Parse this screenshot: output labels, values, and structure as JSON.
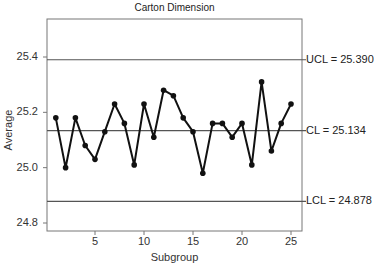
{
  "chart_data": {
    "type": "line",
    "title": "Carton Dimension",
    "xlabel": "Subgroup",
    "ylabel": "Average",
    "x": [
      1,
      2,
      3,
      4,
      5,
      6,
      7,
      8,
      9,
      10,
      11,
      12,
      13,
      14,
      15,
      16,
      17,
      18,
      19,
      20,
      21,
      22,
      23,
      24,
      25
    ],
    "series": [
      {
        "name": "Subgroup average",
        "values": [
          25.18,
          25.0,
          25.18,
          25.08,
          25.03,
          25.13,
          25.23,
          25.16,
          25.01,
          25.23,
          25.11,
          25.28,
          25.26,
          25.18,
          25.13,
          24.98,
          25.16,
          25.16,
          25.11,
          25.16,
          25.01,
          25.31,
          25.06,
          25.16,
          25.23
        ]
      }
    ],
    "control_limits": {
      "ucl": 25.39,
      "cl": 25.134,
      "lcl": 24.878,
      "ucl_label": "UCL = 25.390",
      "cl_label": "CL = 25.134",
      "lcl_label": "LCL = 24.878"
    },
    "xlim": [
      0,
      26
    ],
    "ylim": [
      24.78,
      25.53
    ],
    "xticks": [
      5,
      10,
      15,
      20,
      25
    ],
    "yticks": [
      24.8,
      25.0,
      25.2,
      25.4
    ],
    "xtick_labels": [
      "5",
      "10",
      "15",
      "20",
      "25"
    ],
    "ytick_labels": [
      "24.8",
      "25.0",
      "25.2",
      "25.4"
    ],
    "grid": false,
    "legend": "none"
  }
}
